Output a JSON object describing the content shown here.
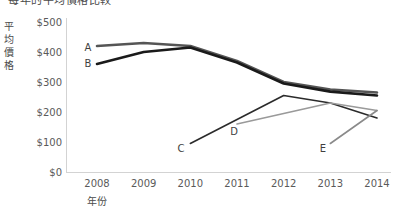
{
  "chart_data": {
    "type": "line",
    "title": "每年的平均價格比較",
    "xlabel": "年份",
    "ylabel": "平均價格",
    "categories": [
      "2008",
      "2009",
      "2010",
      "2011",
      "2012",
      "2013",
      "2014"
    ],
    "x": [
      2008,
      2009,
      2010,
      2011,
      2012,
      2013,
      2014
    ],
    "ylim": [
      0,
      500
    ],
    "yticks": [
      "$0",
      "$100",
      "$200",
      "$300",
      "$400",
      "$500"
    ],
    "ytick_values": [
      0,
      100,
      200,
      300,
      400,
      500
    ],
    "grid": false,
    "legend": "inline-labels",
    "series": [
      {
        "name": "A",
        "color": "#555555",
        "width": 2.6,
        "x": [
          2008,
          2009,
          2010,
          2011,
          2012,
          2013,
          2014
        ],
        "values": [
          420,
          430,
          420,
          370,
          300,
          275,
          265
        ]
      },
      {
        "name": "B",
        "color": "#1a1a1a",
        "width": 2.6,
        "x": [
          2008,
          2009,
          2010,
          2011,
          2012,
          2013,
          2014
        ],
        "values": [
          360,
          400,
          415,
          365,
          295,
          268,
          255
        ]
      },
      {
        "name": "C",
        "color": "#2b2b2b",
        "width": 1.6,
        "x": [
          2010,
          2011,
          2012,
          2013,
          2014
        ],
        "values": [
          95,
          175,
          255,
          230,
          180
        ]
      },
      {
        "name": "D",
        "color": "#9a9a9a",
        "width": 1.6,
        "x": [
          2011,
          2012,
          2013,
          2014
        ],
        "values": [
          160,
          195,
          230,
          205
        ]
      },
      {
        "name": "E",
        "color": "#8a8a8a",
        "width": 1.6,
        "x": [
          2013,
          2014
        ],
        "values": [
          95,
          205
        ]
      }
    ],
    "series_label_positions": [
      {
        "name": "A",
        "x": 88,
        "y": 47
      },
      {
        "name": "B",
        "x": 88,
        "y": 63
      },
      {
        "name": "C",
        "x": 181,
        "y": 148
      },
      {
        "name": "D",
        "x": 234,
        "y": 131
      },
      {
        "name": "E",
        "x": 323,
        "y": 148
      }
    ]
  }
}
